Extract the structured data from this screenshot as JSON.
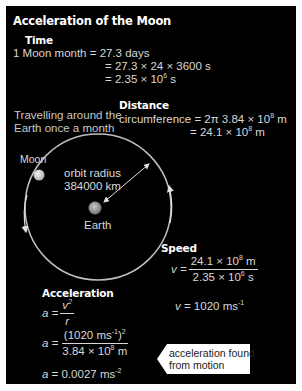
{
  "title": "Acceleration of the Moon",
  "time": {
    "heading": "Time",
    "line1_lhs": "1 Moon month",
    "line1_rhs": "= 27.3 days",
    "line2": "= 27.3 × 24 × 3600 s",
    "line3_base": "= 2.35 × 10",
    "line3_exp": "6",
    "line3_unit": " s"
  },
  "travel_note": {
    "line1": "Travelling around the",
    "line2": "Earth once a month"
  },
  "distance": {
    "heading": "Distance",
    "line1_base": "circumference = 2π 3.84 × 10",
    "line1_exp": "8",
    "line1_unit": " m",
    "line2_base": "= 24.1 × 10",
    "line2_exp": "8",
    "line2_unit": " m"
  },
  "diagram": {
    "moon_label": "Moon",
    "radius_label_1": "orbit radius",
    "radius_label_2": "384000 km",
    "earth_label": "Earth",
    "colors": {
      "orbit": "#bfbfbf",
      "moon": "#d9d9d9",
      "earth": "#a0a0a0",
      "background": "#000000"
    }
  },
  "speed": {
    "heading": "Speed",
    "v_lhs": "v =",
    "num_base": "24.1 × 10",
    "num_exp": "8",
    "num_unit": " m",
    "den_base": "2.35 × 10",
    "den_exp": "6",
    "den_unit": " s",
    "result_lhs": "v",
    "result_base": " = 1020 ms",
    "result_exp": "-1"
  },
  "acceleration": {
    "heading": "Acceleration",
    "a_lhs": "a =",
    "f1_num": "v",
    "f1_num_exp": "2",
    "f1_den": "r",
    "f2_num_base": "(1020 ms",
    "f2_num_exp1": "-1",
    "f2_num_close": ")",
    "f2_num_exp2": "2",
    "f2_den_base": "3.84 × 10",
    "f2_den_exp": "8",
    "f2_den_unit": " m",
    "result_lhs": "a",
    "result_base": " = 0.0027 ms",
    "result_exp": "-2"
  },
  "callout": {
    "line1": "acceleration found",
    "line2": "from motion"
  }
}
